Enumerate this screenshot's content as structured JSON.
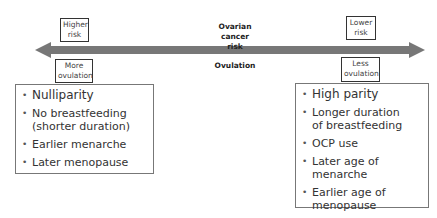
{
  "diagram": {
    "axis": {
      "title_line1": "Ovarian cancer",
      "title_line2": "risk",
      "subtitle": "Ovulation",
      "arrow_color": "#777777"
    },
    "left": {
      "risk_tag_line1": "Higher",
      "risk_tag_line2": "risk",
      "ovulation_tag_line1": "More",
      "ovulation_tag_line2": "ovulation",
      "factors": [
        "Nulliparity",
        "No breastfeeding (shorter duration)",
        "Earlier menarche",
        "Later menopause"
      ]
    },
    "right": {
      "risk_tag_line1": "Lower",
      "risk_tag_line2": "risk",
      "ovulation_tag_line1": "Less",
      "ovulation_tag_line2": "ovulation",
      "factors": [
        "High parity",
        "Longer duration of breastfeeding",
        "OCP use",
        "Later age of menarche",
        "Earlier age of menopause"
      ]
    }
  }
}
